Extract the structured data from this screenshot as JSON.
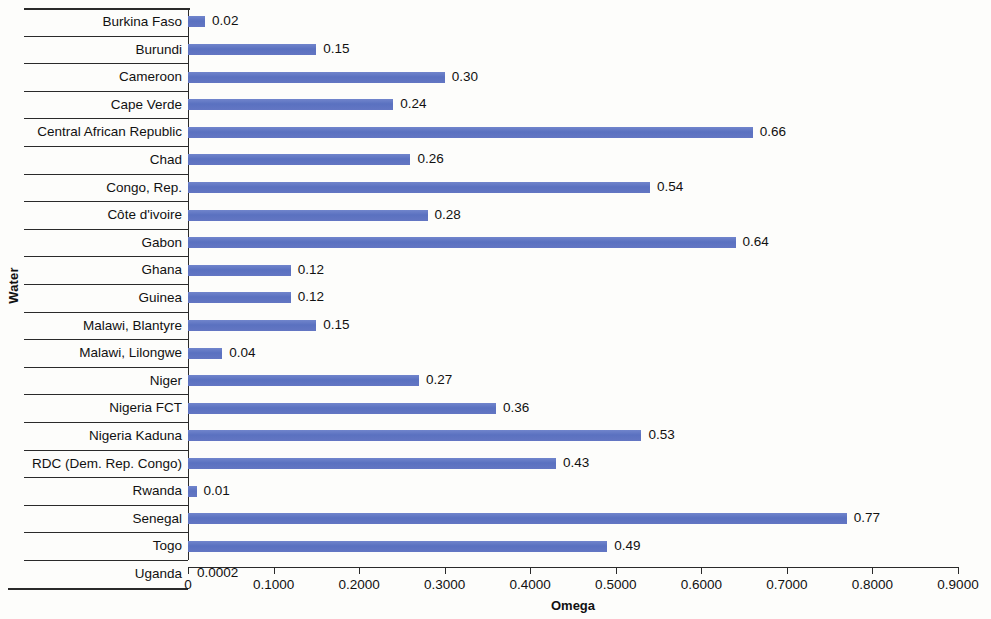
{
  "chart_data": {
    "type": "bar",
    "orientation": "horizontal",
    "title": "",
    "xlabel": "Omega",
    "ylabel": "Water",
    "xlim": [
      0,
      0.9
    ],
    "grid": false,
    "legend": null,
    "xticks": [
      "0",
      "0.1000",
      "0.2000",
      "0.3000",
      "0.4000",
      "0.5000",
      "0.6000",
      "0.7000",
      "0.8000",
      "0.9000"
    ],
    "xtick_values": [
      0,
      0.1,
      0.2,
      0.3,
      0.4,
      0.5,
      0.6,
      0.7,
      0.8,
      0.9
    ],
    "categories": [
      "Burkina Faso",
      "Burundi",
      "Cameroon",
      "Cape Verde",
      "Central African Republic",
      "Chad",
      "Congo, Rep.",
      "Côte d'ivoire",
      "Gabon",
      "Ghana",
      "Guinea",
      "Malawi, Blantyre",
      "Malawi, Lilongwe",
      "Niger",
      "Nigeria  FCT",
      "Nigeria Kaduna",
      "RDC (Dem. Rep. Congo)",
      "Rwanda",
      "Senegal",
      "Togo",
      "Uganda"
    ],
    "values": [
      0.02,
      0.15,
      0.3,
      0.24,
      0.66,
      0.26,
      0.54,
      0.28,
      0.64,
      0.12,
      0.12,
      0.15,
      0.04,
      0.27,
      0.36,
      0.53,
      0.43,
      0.01,
      0.77,
      0.49,
      0.0002
    ],
    "data_labels": [
      "0.02",
      "0.15",
      "0.30",
      "0.24",
      "0.66",
      "0.26",
      "0.54",
      "0.28",
      "0.64",
      "0.12",
      "0.12",
      "0.15",
      "0.04",
      "0.27",
      "0.36",
      "0.53",
      "0.43",
      "0.01",
      "0.77",
      "0.49",
      "0.0002"
    ],
    "bar_color": "#6076c4",
    "axis_color": "#2a2a2a",
    "background_color": "#fdfdfb"
  }
}
